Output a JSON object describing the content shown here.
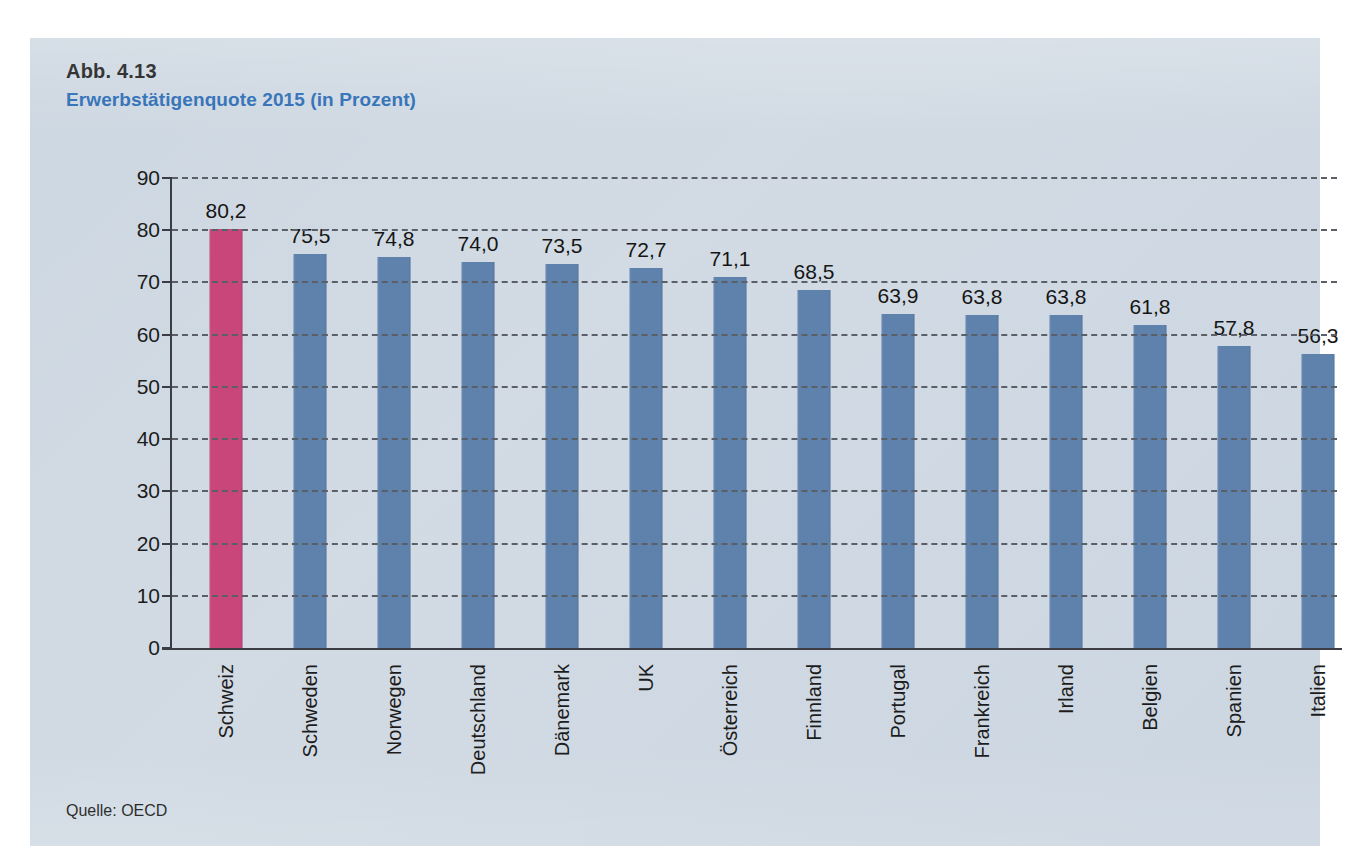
{
  "figure": {
    "number": "Abb. 4.13",
    "title": "Erwerbstätigenquote 2015 (in Prozent)",
    "source": "Quelle: OECD"
  },
  "colors": {
    "panel_background": "#ccd6e1",
    "title_blue": "#2b6cb5",
    "bar_blue": "#5f82ad",
    "bar_highlight_pink": "#c8467a",
    "axis": "#3c3c44",
    "gridline": "#5a5f68"
  },
  "chart_data": {
    "type": "bar",
    "title": "Erwerbstätigenquote 2015 (in Prozent)",
    "xlabel": "",
    "ylabel": "",
    "ylim": [
      0,
      90
    ],
    "yticks": [
      0,
      10,
      20,
      30,
      40,
      50,
      60,
      70,
      80,
      90
    ],
    "ytick_labels": [
      "0",
      "10",
      "20",
      "30",
      "40",
      "50",
      "60",
      "70",
      "80",
      "90"
    ],
    "grid": true,
    "legend": false,
    "decimal_separator": ",",
    "categories": [
      "Schweiz",
      "Schweden",
      "Norwegen",
      "Deutschland",
      "Dänemark",
      "UK",
      "Österreich",
      "Finnland",
      "Portugal",
      "Frankreich",
      "Irland",
      "Belgien",
      "Spanien",
      "Italien"
    ],
    "values": [
      80.2,
      75.5,
      74.8,
      74.0,
      73.5,
      72.7,
      71.1,
      68.5,
      63.9,
      63.8,
      63.8,
      61.8,
      57.8,
      56.3
    ],
    "value_labels": [
      "80,2",
      "75,5",
      "74,8",
      "74,0",
      "73,5",
      "72,7",
      "71,1",
      "68,5",
      "63,9",
      "63,8",
      "63,8",
      "61,8",
      "57,8",
      "56,3"
    ],
    "highlight_index": 0,
    "source": "Quelle: OECD"
  }
}
